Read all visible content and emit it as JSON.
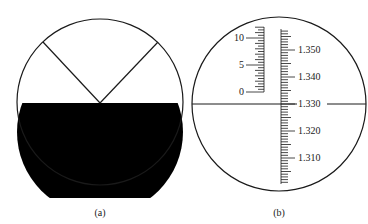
{
  "panels": [
    {
      "id": "a",
      "caption": "(a)",
      "description": "Field of view split: upper half light with V-shaped crosshair lines, lower half dark"
    },
    {
      "id": "b",
      "caption": "(b)",
      "left_scale": {
        "labels": [
          "10",
          "5",
          "0"
        ],
        "min": 0,
        "max": 10,
        "minor_step": 0.5
      },
      "right_scale": {
        "labels": [
          "1.350",
          "1.340",
          "1.330",
          "1.320",
          "1.310"
        ],
        "min": 1.3,
        "max": 1.36,
        "minor_step": 0.001,
        "reading_line": "1.330"
      }
    }
  ],
  "colors": {
    "line": "#1a1a1a",
    "dark_field": "#000000",
    "background": "#ffffff"
  }
}
